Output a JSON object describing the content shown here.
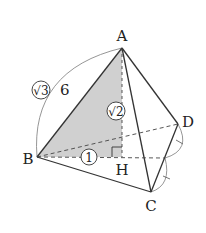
{
  "diagram": {
    "type": "tetrahedron",
    "vertices": {
      "A": "A",
      "B": "B",
      "C": "C",
      "D": "D",
      "H": "H"
    },
    "annotations": {
      "edge_AB_length": "6",
      "edge_AB_ratio_root": "√3",
      "height_AH_ratio_root": "√2",
      "segment_BH_ratio": "1"
    },
    "colors": {
      "shade": "#cfcfcf",
      "line": "#333333",
      "arc": "#888888"
    }
  }
}
